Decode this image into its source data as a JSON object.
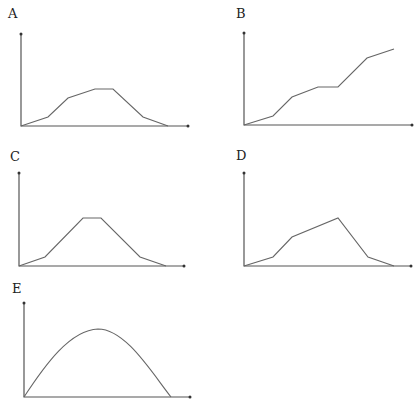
{
  "panels": [
    {
      "id": "A",
      "label": "A",
      "label_pos": [
        8,
        18
      ],
      "origin": [
        21,
        126
      ],
      "y_top": 34,
      "x_end": 188,
      "curve_type": "polyline",
      "points": [
        [
          21,
          126
        ],
        [
          48,
          117
        ],
        [
          68,
          98
        ],
        [
          95,
          89
        ],
        [
          113,
          89
        ],
        [
          143,
          117
        ],
        [
          168,
          126
        ]
      ]
    },
    {
      "id": "B",
      "label": "B",
      "label_pos": [
        236,
        18
      ],
      "origin": [
        244,
        125
      ],
      "y_top": 33,
      "x_end": 412,
      "curve_type": "polyline",
      "points": [
        [
          244,
          125
        ],
        [
          273,
          116
        ],
        [
          292,
          97
        ],
        [
          318,
          87
        ],
        [
          338,
          87
        ],
        [
          367,
          58
        ],
        [
          394,
          49
        ]
      ]
    },
    {
      "id": "C",
      "label": "C",
      "label_pos": [
        10,
        161
      ],
      "origin": [
        19,
        266
      ],
      "y_top": 173,
      "x_end": 184,
      "curve_type": "polyline",
      "points": [
        [
          19,
          266
        ],
        [
          45,
          257
        ],
        [
          83,
          218
        ],
        [
          101,
          218
        ],
        [
          140,
          257
        ],
        [
          166,
          266
        ]
      ]
    },
    {
      "id": "D",
      "label": "D",
      "label_pos": [
        236,
        160
      ],
      "origin": [
        244,
        266
      ],
      "y_top": 173,
      "x_end": 411,
      "curve_type": "polyline",
      "points": [
        [
          244,
          266
        ],
        [
          273,
          257
        ],
        [
          292,
          237
        ],
        [
          338,
          218
        ],
        [
          368,
          257
        ],
        [
          394,
          266
        ]
      ]
    },
    {
      "id": "E",
      "label": "E",
      "label_pos": [
        12,
        293
      ],
      "origin": [
        24,
        397
      ],
      "y_top": 303,
      "x_end": 190,
      "curve_type": "smooth",
      "path": "M24,397 C45,365 70,330 98,329 C125,329 150,370 171,397"
    }
  ],
  "colors": {
    "axis": "#555555",
    "curve": "#666666",
    "label": "#222222",
    "background": "#ffffff"
  }
}
